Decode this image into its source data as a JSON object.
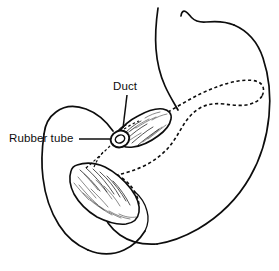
{
  "figure": {
    "kind": "medical-line-illustration",
    "background_color": "#ffffff",
    "ink_color": "#0d0d0d",
    "width": 279,
    "height": 271
  },
  "labels": [
    {
      "id": "duct",
      "text": "Duct",
      "x": 113,
      "y": 81,
      "leader": "vertical line down to the duct at the tube ring"
    },
    {
      "id": "rubber-tube",
      "text": "Rubber tube",
      "x": 9,
      "y": 133,
      "leader": "horizontal line right to the ring encircling the duct"
    }
  ],
  "structures": [
    {
      "id": "stomach",
      "name": "Stomach",
      "style": "solid-outline",
      "note": "Large organ occupying upper right; cardiac notch at top, greater curvature sweeping to lower right"
    },
    {
      "id": "duodenum",
      "name": "Duodenum",
      "style": "solid-outline",
      "note": "C-shaped loop at lower left curving around the pancreatic head"
    },
    {
      "id": "pancreas-head",
      "name": "Pancreas head",
      "style": "stippled-solid",
      "note": "Crescent shaped, textured, lower left within the duodenal loop"
    },
    {
      "id": "pancreas-neck",
      "name": "Pancreas neck segment",
      "style": "stippled-solid",
      "note": "Textured wedge at centre where the duct emerges"
    },
    {
      "id": "pancreas-body-tail",
      "name": "Pancreas body and tail",
      "style": "dotted-outline",
      "note": "Hidden behind the stomach, drawn with a dotted contour extending to the right"
    },
    {
      "id": "duct",
      "name": "Pancreatic duct",
      "style": "dashed-line",
      "note": "Runs from the pancreatic head up to the ring at the centre"
    },
    {
      "id": "rubber-tube",
      "name": "Rubber tube",
      "style": "ring",
      "note": "Small loop encircling and occluding the duct at the centre of the figure"
    }
  ]
}
